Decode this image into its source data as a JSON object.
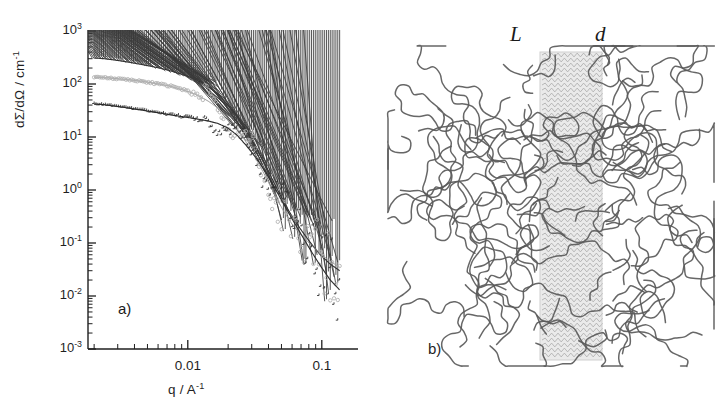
{
  "figure": {
    "panels": [
      {
        "tag": "a)",
        "kind": "scattering-plot"
      },
      {
        "tag": "b)",
        "kind": "lamella-schematic"
      }
    ]
  },
  "panel_a": {
    "tag": "a)",
    "ylabel": "dΣ/dΩ / cm",
    "ylabel_exponent": "-1",
    "xlabel": "q / A",
    "xlabel_exponent": "-1",
    "ytick_labels": [
      "10",
      "10",
      "10",
      "10",
      "10",
      "10",
      "10"
    ],
    "ytick_exponents": [
      "3",
      "2",
      "1",
      "0",
      "-1",
      "-2",
      "-3"
    ],
    "xtick_labels": [
      "0.01",
      "0.1"
    ]
  },
  "panel_b": {
    "tag": "b)",
    "label_L": "L",
    "label_d": "d"
  },
  "colors": {
    "axis": "#1f1f1f",
    "series_dark": "#2b2b2b",
    "series_mid": "#8a8a8a",
    "series_light": "#b9b9b9",
    "chain": "#5a5a5a",
    "lamella_fill": "#d8d8d8"
  },
  "chart_data": {
    "type": "scatter",
    "title": "",
    "xlabel": "q / A^-1",
    "ylabel": "dSigma/dOmega / cm^-1",
    "xscale": "log",
    "yscale": "log",
    "xlim": [
      0.0018,
      0.18
    ],
    "ylim": [
      0.001,
      1000
    ],
    "xticks": [
      0.01,
      0.1
    ],
    "yticks": [
      0.001,
      0.01,
      0.1,
      1,
      10,
      100,
      1000
    ],
    "grid": false,
    "legend": "none",
    "series": [
      {
        "name": "sample-1-triangles",
        "marker": "triangle",
        "color": "#3a3a3a",
        "fit_line": true,
        "x": [
          0.002,
          0.0024,
          0.0028,
          0.0033,
          0.0039,
          0.0046,
          0.0054,
          0.0064,
          0.0075,
          0.0088,
          0.0104,
          0.0122,
          0.0143,
          0.0168,
          0.0197,
          0.0232,
          0.0272,
          0.032,
          0.0376,
          0.0441,
          0.0518,
          0.0608,
          0.0714,
          0.0839,
          0.0985,
          0.1157,
          0.1359
        ],
        "y": [
          310,
          300,
          285,
          268,
          250,
          232,
          214,
          196,
          176,
          156,
          135,
          112,
          88,
          64,
          42,
          25,
          13.5,
          6.6,
          3.1,
          1.35,
          0.6,
          0.3,
          0.165,
          0.095,
          0.058,
          0.04,
          0.03
        ]
      },
      {
        "name": "sample-2-open-circles",
        "marker": "circle-open",
        "color": "#b0b0b0",
        "fit_line": true,
        "x": [
          0.002,
          0.0024,
          0.0028,
          0.0033,
          0.0039,
          0.0046,
          0.0054,
          0.0064,
          0.0075,
          0.0088,
          0.0104,
          0.0122,
          0.0143,
          0.0168,
          0.0197,
          0.0232,
          0.0272,
          0.032,
          0.0376,
          0.0441,
          0.0518,
          0.0608,
          0.0714,
          0.0839,
          0.0985,
          0.1157,
          0.1359
        ],
        "y": [
          135,
          132,
          128,
          123,
          118,
          112,
          105,
          98,
          90,
          80,
          70,
          59,
          47,
          35,
          24,
          15,
          8.0,
          4.0,
          1.9,
          0.86,
          0.4,
          0.215,
          0.135,
          0.09,
          0.062,
          0.045,
          0.035
        ]
      },
      {
        "name": "sample-3-plus",
        "marker": "plus",
        "color": "#2b2b2b",
        "fit_line": true,
        "x": [
          0.002,
          0.0024,
          0.0028,
          0.0033,
          0.0039,
          0.0046,
          0.0054,
          0.0064,
          0.0075,
          0.0088,
          0.0104,
          0.0122,
          0.0143,
          0.0168,
          0.0197,
          0.0232,
          0.0272,
          0.032,
          0.0376,
          0.0441,
          0.0518,
          0.0608,
          0.0714,
          0.0839,
          0.0985,
          0.1157,
          0.1359
        ],
        "y": [
          42,
          40.5,
          38.5,
          36.5,
          34,
          32,
          30,
          28,
          26,
          24.5,
          23,
          21.5,
          20,
          18,
          15,
          11,
          7.0,
          4.2,
          2.3,
          1.15,
          0.55,
          0.27,
          0.135,
          0.068,
          0.036,
          0.02,
          0.013
        ]
      }
    ]
  }
}
